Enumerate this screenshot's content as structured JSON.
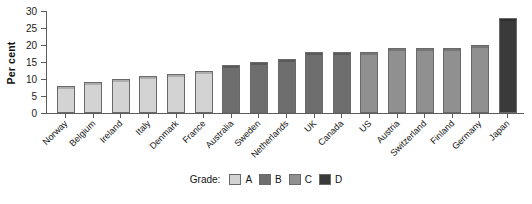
{
  "chart_data": {
    "type": "bar",
    "title": "",
    "xlabel": "",
    "ylabel": "Per cent",
    "ylim": [
      0,
      30
    ],
    "yticks": [
      0,
      5,
      10,
      15,
      20,
      25,
      30
    ],
    "grid": false,
    "legend_position": "bottom",
    "legend_title": "Grade:",
    "categories": [
      "Norway",
      "Belgium",
      "Ireland",
      "Italy",
      "Denmark",
      "France",
      "Australia",
      "Sweden",
      "Netherlands",
      "UK",
      "Canada",
      "US",
      "Austria",
      "Switzerland",
      "Finland",
      "Germany",
      "Japan"
    ],
    "values": [
      8,
      9,
      10,
      11,
      11.5,
      12.5,
      14,
      15,
      16,
      18,
      18,
      18,
      19,
      19,
      19,
      20,
      28
    ],
    "grades": [
      "A",
      "A",
      "A",
      "A",
      "A",
      "A",
      "B",
      "B",
      "B",
      "B",
      "B",
      "C",
      "C",
      "C",
      "C",
      "C",
      "D"
    ],
    "series": [
      {
        "name": "A",
        "color": "#d3d3d3",
        "points": [
          {
            "category": "Norway",
            "value": 8
          },
          {
            "category": "Belgium",
            "value": 9
          },
          {
            "category": "Ireland",
            "value": 10
          },
          {
            "category": "Italy",
            "value": 11
          },
          {
            "category": "Denmark",
            "value": 11.5
          },
          {
            "category": "France",
            "value": 12.5
          }
        ]
      },
      {
        "name": "B",
        "color": "#6e6e6e",
        "points": [
          {
            "category": "Australia",
            "value": 14
          },
          {
            "category": "Sweden",
            "value": 15
          },
          {
            "category": "Netherlands",
            "value": 16
          },
          {
            "category": "UK",
            "value": 18
          },
          {
            "category": "Canada",
            "value": 18
          }
        ]
      },
      {
        "name": "C",
        "color": "#909090",
        "points": [
          {
            "category": "US",
            "value": 18
          },
          {
            "category": "Austria",
            "value": 19
          },
          {
            "category": "Switzerland",
            "value": 19
          },
          {
            "category": "Finland",
            "value": 19
          },
          {
            "category": "Germany",
            "value": 20
          }
        ]
      },
      {
        "name": "D",
        "color": "#3a3a3a",
        "points": [
          {
            "category": "Japan",
            "value": 28
          }
        ]
      }
    ],
    "legend": [
      {
        "label": "A",
        "color": "#d3d3d3"
      },
      {
        "label": "B",
        "color": "#6e6e6e"
      },
      {
        "label": "C",
        "color": "#909090"
      },
      {
        "label": "D",
        "color": "#3a3a3a"
      }
    ]
  },
  "colors": {
    "grade_a": "#d3d3d3",
    "grade_b": "#6e6e6e",
    "grade_c": "#909090",
    "grade_d": "#3a3a3a",
    "axis": "#5c5c5c",
    "text": "#111111",
    "background": "#ffffff"
  }
}
